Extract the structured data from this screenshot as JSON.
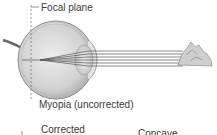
{
  "diagram": {
    "labels": {
      "focal_plane": "Focal plane",
      "myopia": "Myopia (uncorrected)",
      "corrected": "Corrected",
      "concave": "Concave"
    },
    "colors": {
      "eye_fill": "#d9d9d9",
      "eye_outline": "#8a8a8a",
      "ray": "#555555",
      "text": "#3a3a3a",
      "dashed_line": "#777777"
    }
  }
}
